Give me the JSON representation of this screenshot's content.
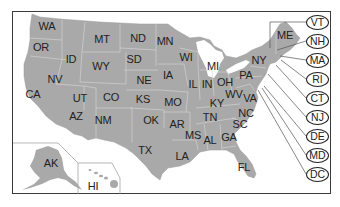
{
  "map": {
    "title": "United States",
    "land_color": "#a9a9a9",
    "border_color": "#d9d9d9",
    "frame_color": "#3a3a3a",
    "states": [
      {
        "abbr": "WA",
        "x": 47,
        "y": 26
      },
      {
        "abbr": "OR",
        "x": 41,
        "y": 47
      },
      {
        "abbr": "CA",
        "x": 33,
        "y": 94
      },
      {
        "abbr": "NV",
        "x": 55,
        "y": 79
      },
      {
        "abbr": "ID",
        "x": 71,
        "y": 59
      },
      {
        "abbr": "MT",
        "x": 102,
        "y": 39
      },
      {
        "abbr": "WY",
        "x": 101,
        "y": 66
      },
      {
        "abbr": "UT",
        "x": 80,
        "y": 98
      },
      {
        "abbr": "CO",
        "x": 111,
        "y": 97
      },
      {
        "abbr": "AZ",
        "x": 76,
        "y": 116
      },
      {
        "abbr": "NM",
        "x": 103,
        "y": 120
      },
      {
        "abbr": "ND",
        "x": 138,
        "y": 38
      },
      {
        "abbr": "SD",
        "x": 134,
        "y": 59
      },
      {
        "abbr": "NE",
        "x": 144,
        "y": 80
      },
      {
        "abbr": "KS",
        "x": 143,
        "y": 99
      },
      {
        "abbr": "OK",
        "x": 151,
        "y": 120
      },
      {
        "abbr": "TX",
        "x": 145,
        "y": 150
      },
      {
        "abbr": "MN",
        "x": 165,
        "y": 41
      },
      {
        "abbr": "IA",
        "x": 168,
        "y": 75
      },
      {
        "abbr": "MO",
        "x": 173,
        "y": 102
      },
      {
        "abbr": "AR",
        "x": 177,
        "y": 124
      },
      {
        "abbr": "LA",
        "x": 182,
        "y": 156
      },
      {
        "abbr": "WI",
        "x": 186,
        "y": 57
      },
      {
        "abbr": "IL",
        "x": 193,
        "y": 84
      },
      {
        "abbr": "MS",
        "x": 193,
        "y": 135
      },
      {
        "abbr": "MI",
        "x": 213,
        "y": 66
      },
      {
        "abbr": "IN",
        "x": 207,
        "y": 84
      },
      {
        "abbr": "OH",
        "x": 225,
        "y": 82
      },
      {
        "abbr": "KY",
        "x": 217,
        "y": 103
      },
      {
        "abbr": "TN",
        "x": 210,
        "y": 117
      },
      {
        "abbr": "AL",
        "x": 210,
        "y": 140
      },
      {
        "abbr": "GA",
        "x": 229,
        "y": 137
      },
      {
        "abbr": "FL",
        "x": 244,
        "y": 167
      },
      {
        "abbr": "SC",
        "x": 240,
        "y": 124
      },
      {
        "abbr": "NC",
        "x": 246,
        "y": 113
      },
      {
        "abbr": "WV",
        "x": 234,
        "y": 94
      },
      {
        "abbr": "VA",
        "x": 250,
        "y": 98
      },
      {
        "abbr": "PA",
        "x": 246,
        "y": 75
      },
      {
        "abbr": "NY",
        "x": 259,
        "y": 60
      },
      {
        "abbr": "ME",
        "x": 285,
        "y": 35
      },
      {
        "abbr": "AK",
        "x": 51,
        "y": 163
      },
      {
        "abbr": "HI",
        "x": 93,
        "y": 186
      }
    ],
    "callouts": [
      {
        "abbr": "VT",
        "y": 22
      },
      {
        "abbr": "NH",
        "y": 41
      },
      {
        "abbr": "MA",
        "y": 60
      },
      {
        "abbr": "RI",
        "y": 79
      },
      {
        "abbr": "CT",
        "y": 98
      },
      {
        "abbr": "NJ",
        "y": 117
      },
      {
        "abbr": "DE",
        "y": 136
      },
      {
        "abbr": "MD",
        "y": 155
      },
      {
        "abbr": "DC",
        "y": 174
      }
    ]
  }
}
